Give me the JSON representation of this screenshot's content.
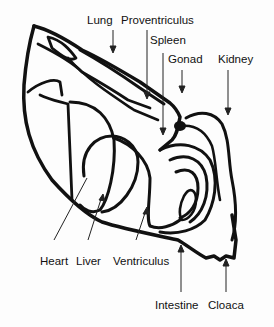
{
  "diagram": {
    "colors": {
      "line": "#111111",
      "background": "#fdfdfd"
    },
    "labels": {
      "lung": "Lung",
      "proventriculus": "Proventriculus",
      "spleen": "Spleen",
      "gonad": "Gonad",
      "kidney": "Kidney",
      "heart": "Heart",
      "liver": "Liver",
      "ventriculus": "Ventriculus",
      "intestine": "Intestine",
      "cloaca": "Cloaca"
    }
  }
}
